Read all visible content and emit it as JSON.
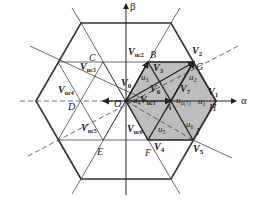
{
  "diagram": {
    "axes": {
      "alpha": "α",
      "beta": "β"
    },
    "points": {
      "O": "O",
      "A": "A",
      "B": "B",
      "C": "C",
      "D": "D",
      "E": "E",
      "F": "F",
      "G": "G",
      "H": "H",
      "I": "I"
    },
    "vectors": {
      "V0": {
        "main": "V",
        "sub": "0"
      },
      "V1": {
        "main": "V",
        "sub": "1"
      },
      "V2": {
        "main": "V",
        "sub": "2"
      },
      "V3": {
        "main": "V",
        "sub": "3"
      },
      "V4": {
        "main": "V",
        "sub": "4"
      },
      "V5": {
        "main": "V",
        "sub": "5"
      },
      "V6": {
        "main": "V",
        "sub": "6"
      },
      "V7": {
        "main": "V",
        "sub": "7"
      },
      "Vuc1": {
        "main": "V",
        "sub": "uc1"
      },
      "Vuc2": {
        "main": "V",
        "sub": "uc2"
      },
      "Vuc3": {
        "main": "V",
        "sub": "uc3"
      },
      "Vuc4": {
        "main": "V",
        "sub": "uc4"
      },
      "Vuc5": {
        "main": "V",
        "sub": "uc5"
      },
      "Vuc6": {
        "main": "V",
        "sub": "uc6"
      }
    },
    "regions": {
      "u1": {
        "main": "u",
        "sub": "1"
      },
      "u2": {
        "main": "u",
        "sub": "2"
      },
      "u3": {
        "main": "u",
        "sub": "3"
      },
      "u4": {
        "main": "u",
        "sub": "4"
      },
      "u5": {
        "main": "u",
        "sub": "5"
      },
      "u6": {
        "main": "u",
        "sub": "6"
      },
      "u07": {
        "main": "u",
        "sub": "0(7)"
      }
    },
    "colors": {
      "shade": "#bdbdbd",
      "line": "#333333"
    }
  }
}
